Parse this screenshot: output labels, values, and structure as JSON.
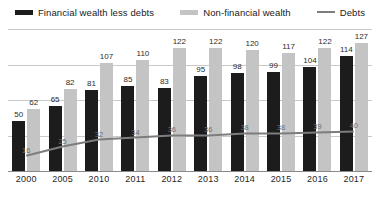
{
  "chart_data": {
    "type": "bar",
    "title": "",
    "subtitle": "",
    "xlabel": "",
    "ylabel": "",
    "ylim": [
      0,
      140
    ],
    "grid": true,
    "gridline_values": [
      35,
      70,
      105,
      140
    ],
    "legend_position": "top",
    "categories": [
      "2000",
      "2005",
      "2010",
      "2011",
      "2012",
      "2013",
      "2014",
      "2015",
      "2016",
      "2017"
    ],
    "series": [
      {
        "name": "Financial wealth less debts",
        "type": "bar",
        "color": "#1c1c1c",
        "values": [
          50,
          65,
          81,
          85,
          83,
          95,
          98,
          99,
          104,
          114
        ]
      },
      {
        "name": "Non-financial wealth",
        "type": "bar",
        "color": "#c4c4c4",
        "values": [
          62,
          82,
          107,
          110,
          122,
          122,
          120,
          117,
          122,
          127
        ]
      },
      {
        "name": "Debts",
        "type": "line",
        "color": "#7d7d7d",
        "values": [
          16,
          25,
          32,
          34,
          36,
          36,
          38,
          38,
          39,
          40
        ]
      }
    ]
  },
  "legend": {
    "items": [
      {
        "label": "Financial wealth less debts",
        "color": "#1c1c1c",
        "marker": "bar"
      },
      {
        "label": "Non-financial wealth",
        "color": "#c4c4c4",
        "marker": "bar"
      },
      {
        "label": "Debts",
        "color": "#7d7d7d",
        "marker": "line"
      }
    ]
  }
}
